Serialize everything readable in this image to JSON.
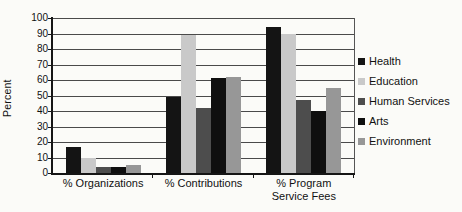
{
  "figure": {
    "background": "#fbfbf8",
    "axis_color": "#151515",
    "gridline_color": "#4a4a4a"
  },
  "chart_data": {
    "type": "bar",
    "title": "",
    "xlabel": "",
    "ylabel": "Percent",
    "ylim": [
      0,
      100
    ],
    "ytick_step": 10,
    "yticks": [
      0,
      10,
      20,
      30,
      40,
      50,
      60,
      70,
      80,
      90,
      100
    ],
    "grid": true,
    "legend_position": "right",
    "categories": [
      "% Organizations",
      "% Contributions",
      "% Program Service Fees"
    ],
    "category_display": [
      [
        "% Organizations"
      ],
      [
        "% Contributions"
      ],
      [
        "% Program",
        "Service Fees"
      ]
    ],
    "series": [
      {
        "name": "Health",
        "color": "#141414",
        "values": [
          17,
          49,
          94
        ]
      },
      {
        "name": "Education",
        "color": "#c9c9c9",
        "values": [
          10,
          89,
          90
        ]
      },
      {
        "name": "Human Services",
        "color": "#4d4d4d",
        "values": [
          4,
          42,
          47
        ]
      },
      {
        "name": "Arts",
        "color": "#0f0f0f",
        "values": [
          4,
          61,
          40
        ]
      },
      {
        "name": "Environment",
        "color": "#979797",
        "values": [
          5,
          62,
          55
        ]
      }
    ]
  }
}
